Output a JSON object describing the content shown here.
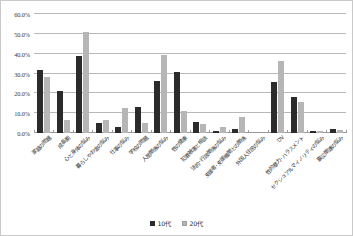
{
  "chart_data": {
    "type": "bar",
    "title": "",
    "subtitle": "",
    "xlabel": "",
    "ylabel": "",
    "ylim": [
      0,
      60
    ],
    "ytick_labels": [
      "0.0%",
      "10.0%",
      "20.0%",
      "30.0%",
      "40.0%",
      "50.0%",
      "60.0%"
    ],
    "ytick_values": [
      0,
      10,
      20,
      30,
      40,
      50,
      60
    ],
    "grid": true,
    "legend_position": "bottom-center",
    "orientation": "vertical",
    "value_unit": "%",
    "categories": [
      "家庭の問題",
      "成長期",
      "心と身体の悩み",
      "暮らしやお金の悩み",
      "仕事の悩み",
      "学校の問題",
      "人間関係の悩み",
      "性の健康",
      "犯罪被害と相談",
      "法的･行政関係の悩み",
      "支援者･支援機関との関係",
      "外国人住民の悩み",
      "DV",
      "性的暴力･ハラスメント",
      "セクシュアルマイノリティの悩み",
      "震災関連の悩み"
    ],
    "series": [
      {
        "name": "10代",
        "color": "#2b2b2b",
        "values": [
          31.8,
          21.0,
          38.7,
          5.2,
          3.2,
          12.9,
          26.1,
          30.8,
          5.6,
          1.2,
          2.1,
          0.0,
          25.6,
          18.2,
          0.8,
          1.9
        ]
      },
      {
        "name": "20代",
        "color": "#b6b6b6",
        "values": [
          28.2,
          6.6,
          50.8,
          6.7,
          12.5,
          4.8,
          39.1,
          11.1,
          4.5,
          2.8,
          8.0,
          0.0,
          36.2,
          15.7,
          0.9,
          1.4
        ]
      }
    ]
  },
  "legend": {
    "items": [
      {
        "label": "10代",
        "swatch": "series-0-swatch"
      },
      {
        "label": "20代",
        "swatch": "series-1-swatch"
      }
    ]
  }
}
